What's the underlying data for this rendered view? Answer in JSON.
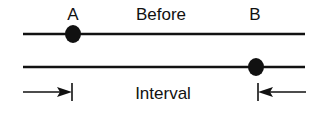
{
  "diagram": {
    "title": "Before",
    "labels": {
      "point_a": "A",
      "point_b": "B",
      "interval": "Interval"
    },
    "colors": {
      "ink": "#111111",
      "background": "#ffffff"
    },
    "lines": [
      {
        "name": "before-line",
        "y": 34,
        "x1": 23,
        "x2": 305,
        "marker": {
          "label": "A",
          "cx": 73
        }
      },
      {
        "name": "after-line",
        "y": 67,
        "x1": 23,
        "x2": 305,
        "marker": {
          "label": "B",
          "cx": 256
        }
      }
    ],
    "interval": {
      "left_tick_x": 72,
      "right_tick_x": 258,
      "y": 92
    }
  }
}
